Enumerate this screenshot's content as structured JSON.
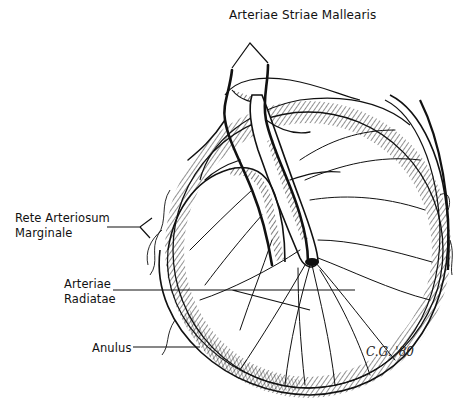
{
  "figure": {
    "labels": {
      "arteriae_striae_mallearis": "Arteriae Striae Mallearis",
      "rete_arteriosum_line1": "Rete Arteriosum",
      "rete_arteriosum_line2": "Marginale",
      "arteriae_radiatae_line1": "Arteriae",
      "arteriae_radiatae_line2": "Radiatae",
      "anulus": "Anulus"
    },
    "signature": "C.G. '80",
    "colors": {
      "ink": "#111111",
      "background": "#ffffff"
    }
  }
}
